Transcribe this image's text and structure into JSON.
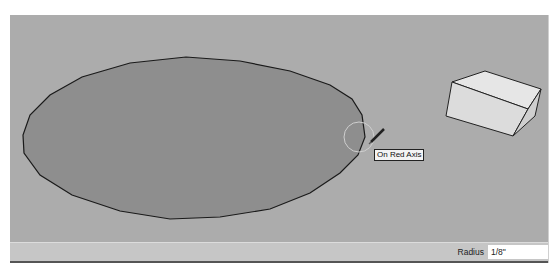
{
  "viewport": {
    "background_color": "#acacac",
    "tooltip": "On Red Axis",
    "cursor_icon": "pencil-icon",
    "objects": [
      {
        "type": "ellipse-face",
        "fill": "#8e8e8e",
        "stroke": "#1a1a1a"
      },
      {
        "type": "box",
        "fill_top": "#e6e6e6",
        "fill_front": "#dcdcdc",
        "fill_side": "#cfcfcf"
      }
    ]
  },
  "statusbar": {
    "measurement_label": "Radius",
    "measurement_value": "1/8\""
  }
}
